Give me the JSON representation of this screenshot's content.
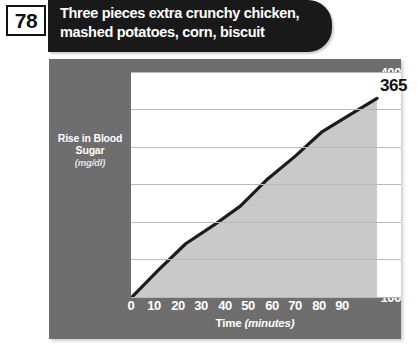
{
  "header": {
    "number": "78",
    "title_lines": [
      "Three pieces extra crunchy chicken,",
      "mashed potatoes, corn, biscuit"
    ]
  },
  "colors": {
    "banner_bg": "#191919",
    "panel_bg": "#6e6e6e",
    "plot_bg": "#ffffff",
    "area_fill": "#c9c9c9",
    "line": "#1c1c1c",
    "gridline": "#b9b9b9",
    "tick_text": "#ffffff"
  },
  "chart_data": {
    "type": "area",
    "title": "Three pieces extra crunchy chicken, mashed potatoes, corn, biscuit",
    "xlabel": "Time",
    "xlabel_unit": "(minutes)",
    "ylabel": "Rise in Blood Sugar",
    "ylabel_unit": "(mg/dl)",
    "x": [
      0,
      10,
      20,
      30,
      40,
      50,
      60,
      70,
      80,
      90
    ],
    "values": [
      100,
      137,
      172,
      196,
      222,
      258,
      288,
      321,
      343,
      365
    ],
    "xlim": [
      0,
      90
    ],
    "ylim": [
      100,
      400
    ],
    "xticks": [
      "0",
      "10",
      "20",
      "30",
      "40",
      "50",
      "60",
      "70",
      "80",
      "90"
    ],
    "yticks": [
      "100",
      "150",
      "200",
      "250",
      "300",
      "350",
      "400"
    ],
    "end_label": "365",
    "grid": true,
    "legend": false
  }
}
